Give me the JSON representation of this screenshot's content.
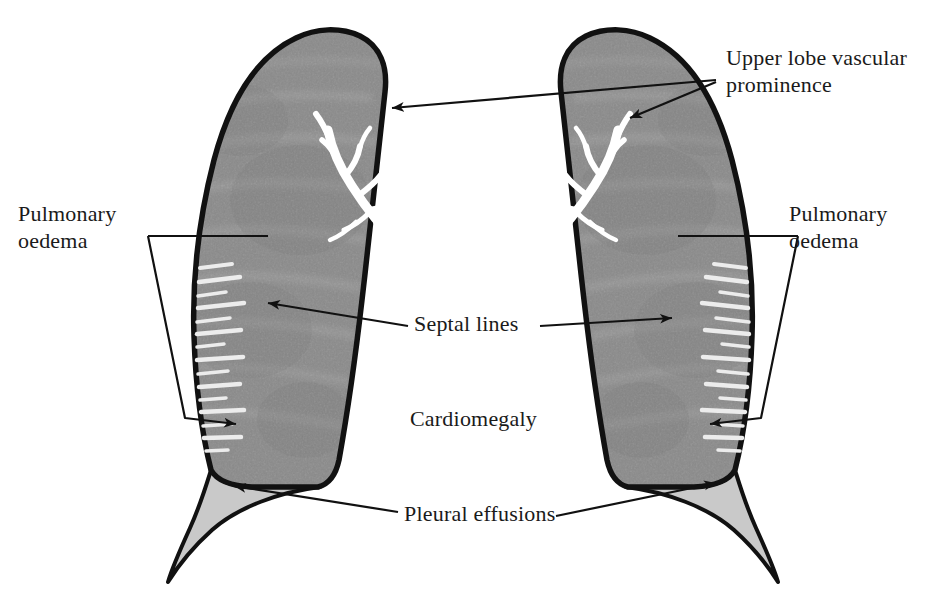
{
  "figure": {
    "type": "annotated-anatomical-diagram",
    "background_color": "#ffffff",
    "outline_color": "#111111",
    "lung_fill_color": "#8a8a8a",
    "effusion_fill_color": "#c9c9c9",
    "vessel_color": "#ffffff",
    "septal_line_color": "#f0f0f0",
    "text_color": "#1a1a1a"
  },
  "labels": {
    "upper_lobe": "Upper lobe vascular\nprominence",
    "pulmonary_oedema_left": "Pulmonary\noedema",
    "pulmonary_oedema_right": "Pulmonary\noedema",
    "septal_lines": "Septal lines",
    "cardiomegaly": "Cardiomegaly",
    "pleural_effusions": "Pleural effusions"
  },
  "annotations": [
    {
      "id": "upper-lobe-vascular-prominence",
      "label": "Upper lobe vascular prominence",
      "pointer_count": 2,
      "targets": [
        "left lung upper zone",
        "right lung upper zone"
      ],
      "label_side": "right"
    },
    {
      "id": "pulmonary-oedema-left",
      "label": "Pulmonary oedema",
      "pointer_count": 1,
      "targets": [
        "left lung mid/lower zone"
      ],
      "label_side": "left",
      "leader_style": "bracket"
    },
    {
      "id": "pulmonary-oedema-right",
      "label": "Pulmonary oedema",
      "pointer_count": 1,
      "targets": [
        "right lung mid/lower zone"
      ],
      "label_side": "right",
      "leader_style": "bracket"
    },
    {
      "id": "septal-lines",
      "label": "Septal lines",
      "pointer_count": 2,
      "targets": [
        "left lung lateral base",
        "right lung lateral base"
      ],
      "label_side": "center"
    },
    {
      "id": "cardiomegaly",
      "label": "Cardiomegaly",
      "pointer_count": 0,
      "targets": [
        "central cardiac silhouette"
      ],
      "label_side": "center"
    },
    {
      "id": "pleural-effusions",
      "label": "Pleural effusions",
      "pointer_count": 2,
      "targets": [
        "left costophrenic angle",
        "right costophrenic angle"
      ],
      "label_side": "center"
    }
  ]
}
